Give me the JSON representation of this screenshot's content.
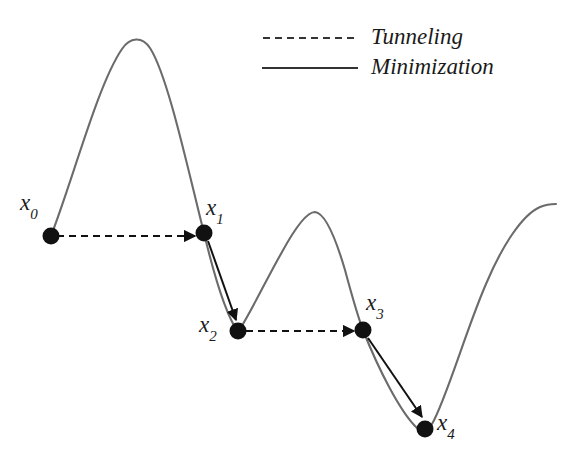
{
  "figure": {
    "type": "diagram",
    "background_color": "#ffffff",
    "curve_color": "#6b6b6b",
    "path_color": "#1a1a1a",
    "point_color": "#111111"
  },
  "legend": {
    "position": "top-right",
    "entries": [
      {
        "label": "Tunneling",
        "style": "dashed",
        "color": "#333333"
      },
      {
        "label": "Minimization",
        "style": "solid",
        "color": "#333333"
      }
    ]
  },
  "points": [
    {
      "id": "x0",
      "base": "x",
      "sub": "0",
      "label": "x0",
      "cx": 51,
      "cy": 236,
      "label_x": 20,
      "label_y": 191
    },
    {
      "id": "x1",
      "base": "x",
      "sub": "1",
      "label": "x1",
      "cx": 204,
      "cy": 233,
      "label_x": 206,
      "label_y": 196
    },
    {
      "id": "x2",
      "base": "x",
      "sub": "2",
      "label": "x2",
      "cx": 238,
      "cy": 331,
      "label_x": 199,
      "label_y": 313
    },
    {
      "id": "x3",
      "base": "x",
      "sub": "3",
      "label": "x3",
      "cx": 363,
      "cy": 330,
      "label_x": 366,
      "label_y": 291
    },
    {
      "id": "x4",
      "base": "x",
      "sub": "4",
      "label": "x4",
      "cx": 425,
      "cy": 429,
      "label_x": 437,
      "label_y": 411
    }
  ],
  "transitions": [
    {
      "kind": "tunneling",
      "from": "x0",
      "to": "x1",
      "x1": 57,
      "y1": 236,
      "x2": 197,
      "y2": 236
    },
    {
      "kind": "minimization",
      "from": "x1",
      "to": "x2",
      "x1": 208,
      "y1": 241,
      "x2": 236,
      "y2": 322
    },
    {
      "kind": "tunneling",
      "from": "x2",
      "to": "x3",
      "x1": 246,
      "y1": 331,
      "x2": 356,
      "y2": 331
    },
    {
      "kind": "minimization",
      "from": "x3",
      "to": "x4",
      "x1": 368,
      "y1": 338,
      "x2": 423,
      "y2": 419
    }
  ],
  "landscape": {
    "description": "objective-function-curve",
    "features": [
      {
        "kind": "start",
        "x": 51,
        "y": 236
      },
      {
        "kind": "maximum",
        "x": 136,
        "y": 39
      },
      {
        "kind": "minimum",
        "x": 238,
        "y": 332
      },
      {
        "kind": "maximum",
        "x": 315,
        "y": 212
      },
      {
        "kind": "minimum",
        "x": 425,
        "y": 432
      },
      {
        "kind": "plateau",
        "x": 556,
        "y": 204
      }
    ],
    "path_d": "M 51 236 C 74 176, 98 84, 122 49 C 130 37, 142 36, 150 48 C 168 76, 188 170, 204 233 C 214 275, 226 315, 238 332 C 250 314, 266 280, 282 252 C 294 230, 306 212, 315 212 C 325 213, 335 236, 345 270 C 352 296, 358 317, 363 330 C 378 368, 400 412, 417 428 C 421 432, 427 433, 432 424 C 446 400, 466 330, 486 284 C 502 246, 522 215, 540 207 C 547 204, 552 204, 556 204"
  }
}
